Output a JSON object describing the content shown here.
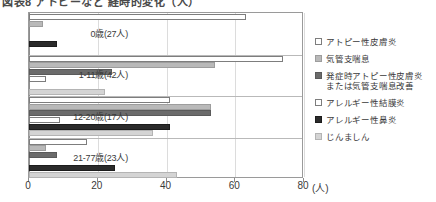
{
  "title": "図表8 アトピーなど 経時的変化（人）",
  "chart_data": {
    "type": "bar",
    "orientation": "horizontal",
    "title": "アトピーなど 経時的変化",
    "xlabel": "(人)",
    "ylabel": "",
    "xlim": [
      0,
      80
    ],
    "xticks": [
      0,
      20,
      40,
      60,
      80
    ],
    "xtick_labels": [
      "0",
      "20",
      "40",
      "60",
      "80"
    ],
    "x_unit_label": "(人)",
    "grid": true,
    "legend_position": "right",
    "categories": [
      "0歳(27人)",
      "1-11歳(42人)",
      "12-20歳(17人)",
      "21-77歳(23人)"
    ],
    "series": [
      {
        "name": "アトピー性皮膚炎",
        "color": "#ffffff",
        "values": [
          63,
          74,
          41,
          17
        ]
      },
      {
        "name": "気管支喘息",
        "color": "#b9b9b9",
        "values": [
          4,
          54,
          53,
          5
        ]
      },
      {
        "name": "発症時アトピー性皮膚炎\nまたは気管支喘息改善",
        "color": "#6b6b6b",
        "values": [
          0,
          24,
          53,
          8
        ]
      },
      {
        "name": "アレルギー性結膜炎",
        "color": "#ffffff",
        "values": [
          0,
          5,
          9,
          0
        ]
      },
      {
        "name": "アレルギー性鼻炎",
        "color": "#2b2b2b",
        "values": [
          8,
          0,
          41,
          25
        ]
      },
      {
        "name": "じんましん",
        "color": "#d4d4d4",
        "values": [
          0,
          22,
          36,
          43
        ]
      }
    ]
  }
}
